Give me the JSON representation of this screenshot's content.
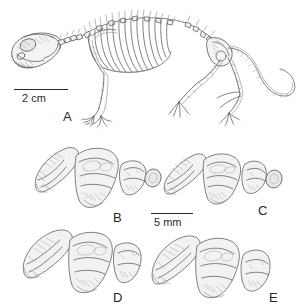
{
  "figure": {
    "type": "scientific-plate",
    "background_color": "#ffffff",
    "ink_color": "#595959",
    "label_color": "#262626",
    "caption_font_size_px": 13,
    "panels": [
      {
        "id": "A",
        "label": "A",
        "subject": "rodent-skeleton-lateral",
        "description": "articulated small mammal skeleton in left lateral view, skull at lower left, ribcage, fore- and hind limbs, long tail curving to the right",
        "label_x": 63,
        "label_y": 110,
        "scale_bar": {
          "label": "2 cm",
          "x": 14,
          "y": 89,
          "length_px": 54,
          "text_x": 22,
          "text_y": 93
        }
      },
      {
        "id": "B",
        "label": "B",
        "subject": "upper-tooth-row-occlusal",
        "description": "three cheek teeth: elongate blade-like anterior premolar, large squared molar, small posterior molar",
        "label_x": 113,
        "label_y": 211
      },
      {
        "id": "C",
        "label": "C",
        "subject": "upper-tooth-row-occlusal",
        "description": "three cheek teeth, anterior blade narrower, posterior molar reduced",
        "label_x": 258,
        "label_y": 204
      },
      {
        "id": "D",
        "label": "D",
        "subject": "upper-tooth-row-occlusal",
        "description": "three cheek teeth, broad anterior blade and robust molars",
        "label_x": 113,
        "label_y": 291
      },
      {
        "id": "E",
        "label": "E",
        "subject": "upper-tooth-row-occlusal",
        "description": "three cheek teeth, elongate anterior blade, wide molar, oval posterior molar",
        "label_x": 269,
        "label_y": 291
      }
    ],
    "scale_bars": [
      {
        "id": "scale-a",
        "label": "2 cm",
        "for_panel": "A",
        "x": 14,
        "y": 89,
        "length_px": 54
      },
      {
        "id": "scale-teeth",
        "label": "5 mm",
        "for_panels": "B,C,D,E",
        "x": 151,
        "y": 213,
        "length_px": 42
      }
    ]
  }
}
